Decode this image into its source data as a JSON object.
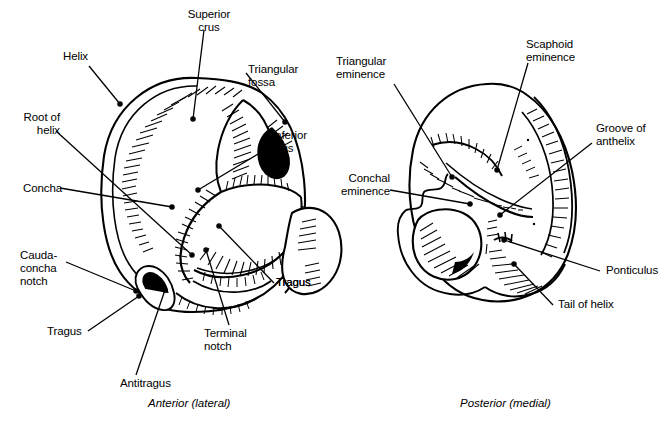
{
  "figure": {
    "ink_color": "#000000",
    "background_color": "#ffffff"
  },
  "panels": [
    {
      "id": "anterior",
      "caption": "Anterior (lateral)",
      "labels": [
        {
          "key": "helix",
          "text": "Helix"
        },
        {
          "key": "superior_crus",
          "text": "Superior\ncrus"
        },
        {
          "key": "triangular_fossa",
          "text": "Triangular\nfossa"
        },
        {
          "key": "root_of_helix",
          "text": "Root of\nhelix"
        },
        {
          "key": "inferior_crus",
          "text": "Inferior\ncrus"
        },
        {
          "key": "concha",
          "text": "Concha"
        },
        {
          "key": "cauda_concha",
          "text": "Cauda-\nconcha\nnotch"
        },
        {
          "key": "tragus",
          "text": "Tragus"
        },
        {
          "key": "tail_of_helix",
          "text": "Tail of\nhelix"
        },
        {
          "key": "terminal_notch",
          "text": "Terminal\nnotch"
        },
        {
          "key": "antitragus",
          "text": "Antitragus"
        }
      ]
    },
    {
      "id": "posterior",
      "caption": "Posterior (medial)",
      "labels": [
        {
          "key": "triangular_eminence",
          "text": "Triangular\neminence"
        },
        {
          "key": "scaphoid_eminence",
          "text": "Scaphoid\neminence"
        },
        {
          "key": "groove_of_anthelix",
          "text": "Groove of\nanthelix"
        },
        {
          "key": "conchal_eminence",
          "text": "Conchal\neminence"
        },
        {
          "key": "ponticulus",
          "text": "Ponticulus"
        },
        {
          "key": "tail_of_helix_post",
          "text": "Tail of helix"
        }
      ]
    }
  ]
}
